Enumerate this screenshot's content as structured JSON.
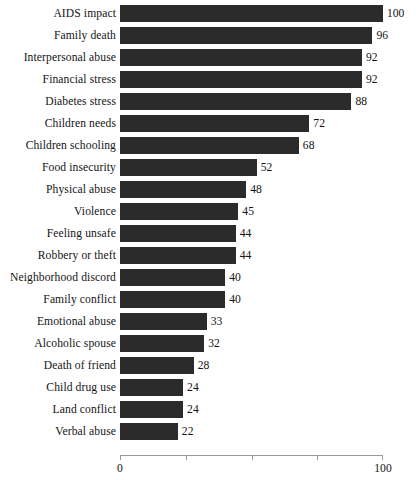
{
  "chart_data": {
    "type": "bar",
    "orientation": "horizontal",
    "title": "",
    "subtitle": "",
    "xlabel": "",
    "ylabel": "",
    "xlim": [
      0,
      100
    ],
    "grid": false,
    "legend": null,
    "bar_color": "#2b2b2b",
    "axis_color": "#9a9a9a",
    "text_color": "#141414",
    "tick_positions": [
      0,
      25,
      50,
      75,
      100
    ],
    "tick_labels": [
      {
        "value": 0,
        "label": "0"
      },
      {
        "value": 25,
        "label": ""
      },
      {
        "value": 50,
        "label": ""
      },
      {
        "value": 75,
        "label": ""
      },
      {
        "value": 100,
        "label": "100"
      }
    ],
    "categories": [
      "AIDS impact",
      "Family death",
      "Interpersonal abuse",
      "Financial stress",
      "Diabetes stress",
      "Children needs",
      "Children schooling",
      "Food insecurity",
      "Physical abuse",
      "Violence",
      "Feeling unsafe",
      "Robbery or theft",
      "Neighborhood discord",
      "Family conflict",
      "Emotional abuse",
      "Alcoholic spouse",
      "Death of friend",
      "Child drug use",
      "Land conflict",
      "Verbal abuse"
    ],
    "values": [
      100,
      96,
      92,
      92,
      88,
      72,
      68,
      52,
      48,
      45,
      44,
      44,
      40,
      40,
      33,
      32,
      28,
      24,
      24,
      22
    ],
    "value_labels": [
      "100",
      "96",
      "92",
      "92",
      "88",
      "72",
      "68",
      "52",
      "48",
      "45",
      "44",
      "44",
      "40",
      "40",
      "33",
      "32",
      "28",
      "24",
      "24",
      "22"
    ]
  }
}
